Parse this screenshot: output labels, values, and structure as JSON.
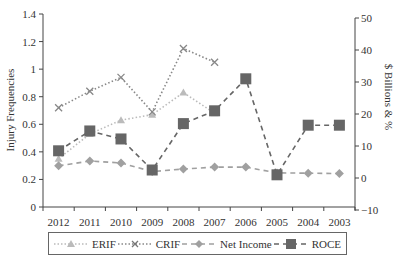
{
  "chart_data": {
    "type": "line",
    "title": "",
    "categories": [
      "2012",
      "2011",
      "2010",
      "2009",
      "2008",
      "2007",
      "2006",
      "2005",
      "2004",
      "2003"
    ],
    "xlabel": "",
    "ylabel": "Injury Frequencies",
    "y2label": "$ Billions & %",
    "ylim": [
      0,
      1.4
    ],
    "y2lim": [
      -10,
      50
    ],
    "yticks": [
      "0",
      "0.2",
      "0.4",
      "0.6",
      "0.8",
      "1",
      "1.2",
      "1.4"
    ],
    "y2ticks": [
      "-10",
      "0",
      "10",
      "20",
      "30",
      "40",
      "50"
    ],
    "grid": false,
    "legend_position": "bottom",
    "series": [
      {
        "name": "ERIF",
        "axis": "left",
        "style": "dotted",
        "marker": "triangle",
        "color": "#bbbbbb",
        "values": [
          0.35,
          0.53,
          0.63,
          0.67,
          0.83,
          0.68,
          null,
          null,
          null,
          null
        ]
      },
      {
        "name": "CRIF",
        "axis": "left",
        "style": "dotted",
        "marker": "x",
        "color": "#888888",
        "values": [
          0.72,
          0.84,
          0.94,
          0.69,
          1.15,
          1.05,
          null,
          null,
          null,
          null
        ]
      },
      {
        "name": "Net Income",
        "axis": "right",
        "style": "dashed",
        "marker": "diamond",
        "color": "#a0a0a0",
        "values": [
          3.8,
          5.3,
          4.7,
          2.0,
          2.8,
          3.4,
          3.4,
          1.6,
          1.5,
          1.4
        ]
      },
      {
        "name": "ROCE",
        "axis": "right",
        "style": "dashed",
        "marker": "square",
        "color": "#666666",
        "values": [
          8.5,
          14.7,
          12.2,
          2.5,
          17.0,
          21.0,
          31.0,
          1.0,
          16.5,
          16.5
        ]
      }
    ]
  },
  "legend": {
    "items": [
      {
        "label": "ERIF"
      },
      {
        "label": "CRIF"
      },
      {
        "label": "Net Income"
      },
      {
        "label": "ROCE"
      }
    ]
  }
}
